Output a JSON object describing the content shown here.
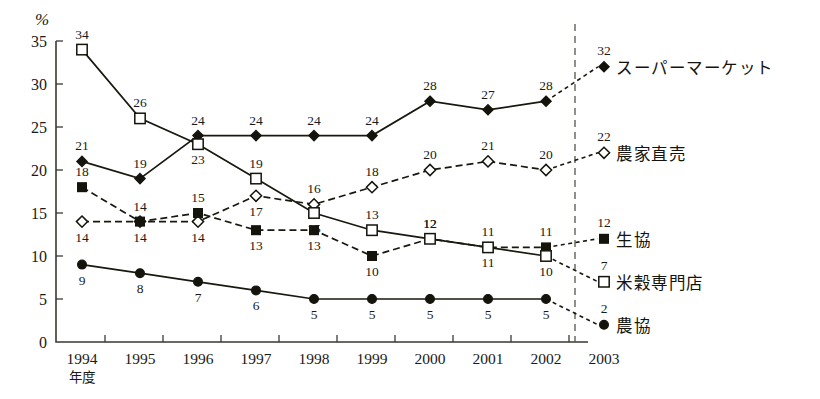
{
  "chart_data": {
    "type": "line",
    "title": "",
    "xlabel": "年度",
    "ylabel": "%",
    "ylim": [
      0,
      35
    ],
    "ytick_values": [
      0,
      5,
      10,
      15,
      20,
      25,
      30,
      35
    ],
    "grid": false,
    "legend_position": "right",
    "categories": [
      "1994",
      "1995",
      "1996",
      "1997",
      "1998",
      "1999",
      "2000",
      "2001",
      "2002",
      "2003"
    ],
    "annotation": {
      "divider_note": "dashed vertical line between 2002 and 2003",
      "projection_note": "2002 to 2003 segments drawn dashed for all series"
    },
    "series": [
      {
        "name": "スーパーマーケット",
        "marker": "filled-diamond",
        "line_style": "solid",
        "end_label": "32",
        "values": [
          21,
          19,
          24,
          24,
          24,
          24,
          28,
          27,
          28,
          32
        ],
        "label_side": [
          "above",
          "above",
          "above",
          "above",
          "above",
          "above",
          "above",
          "above",
          "above",
          "above"
        ]
      },
      {
        "name": "農家直売",
        "marker": "open-diamond",
        "line_style": "dashed",
        "end_label": "22",
        "values": [
          14,
          14,
          14,
          17,
          16,
          18,
          20,
          21,
          20,
          22
        ],
        "label_side": [
          "below",
          "below",
          "below",
          "below",
          "above",
          "above",
          "above",
          "above",
          "above",
          "above"
        ]
      },
      {
        "name": "生協",
        "marker": "filled-square",
        "line_style": "dashed",
        "end_label": "12",
        "values": [
          18,
          14,
          15,
          13,
          13,
          10,
          12,
          11,
          11,
          12
        ],
        "label_side": [
          "above",
          "above",
          "above",
          "below",
          "below",
          "below",
          "above",
          "below",
          "above",
          "above"
        ]
      },
      {
        "name": "米穀専門店",
        "marker": "open-square",
        "line_style": "solid",
        "end_label": "7",
        "values": [
          34,
          26,
          23,
          19,
          15,
          13,
          12,
          11,
          10,
          7
        ],
        "label_side": [
          "above",
          "above",
          "below",
          "above",
          "below",
          "above",
          "above",
          "above",
          "below",
          "above"
        ]
      },
      {
        "name": "農協",
        "marker": "filled-circle",
        "line_style": "solid",
        "end_label": "2",
        "values": [
          9,
          8,
          7,
          6,
          5,
          5,
          5,
          5,
          5,
          2
        ],
        "label_side": [
          "below",
          "below",
          "below",
          "below",
          "below",
          "below",
          "below",
          "below",
          "below",
          "above"
        ]
      }
    ]
  },
  "axis": {
    "y_unit": "%",
    "x_axis_caption": "年度"
  },
  "legend": [
    {
      "label": "スーパーマーケット",
      "value": "32",
      "marker": "filled-diamond"
    },
    {
      "label": "農家直売",
      "value": "22",
      "marker": "open-diamond"
    },
    {
      "label": "生協",
      "value": "12",
      "marker": "filled-square"
    },
    {
      "label": "米穀専門店",
      "value": "7",
      "marker": "open-square"
    },
    {
      "label": "農協",
      "value": "2",
      "marker": "filled-circle"
    }
  ],
  "colors": {
    "ink": "#14140c",
    "axis": "#3a3a33",
    "background": "#ffffff"
  }
}
